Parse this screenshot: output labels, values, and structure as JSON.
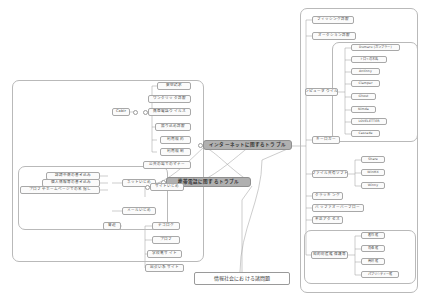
{
  "diagram": {
    "title": "情報社会における諸問題",
    "type": "mind-map",
    "colors": {
      "node_border": "#a8a8a8",
      "node_fill": "#fbfbfb",
      "central_fill": "#b0b0b0",
      "group_border": "#b9b9b9",
      "connector": "#9b9b9b",
      "background": "#ffffff"
    }
  },
  "root": {
    "label": "情報社会における諸問題"
  },
  "central_nodes": {
    "internet": "インターネットに関するトラブル",
    "mobile": "携帯電話に関するトラブル"
  },
  "mobile_branch": {
    "group_label": "mobile-phone-trouble-group",
    "items": [
      {
        "label": "架空請求"
      },
      {
        "label": "ワンクリック詐欺"
      },
      {
        "label": "携帯電話ウイルス",
        "child": "Cabir"
      },
      {
        "label": "振り込め詐欺"
      },
      {
        "label": "利用規約"
      },
      {
        "label": "利用規制"
      },
      {
        "label": "公共の場でのマナー"
      }
    ]
  },
  "bullying_branch": {
    "site_bullying": {
      "label": "サイトいじめ",
      "children": [
        {
          "label": "デコログ"
        },
        {
          "label": "プロフ"
        },
        {
          "label": "学校裏サイト"
        },
        {
          "label": "出会い系サイト"
        }
      ]
    },
    "net_bullying": {
      "label": "ネットいじめ",
      "children": [
        {
          "label": "誹謗中傷の書き込み"
        },
        {
          "label": "個人情報等の書き込み"
        },
        {
          "label": "プロフやホームページでの名指し"
        }
      ]
    },
    "mail_bullying": {
      "label": "メールいじめ",
      "children": [
        {
          "label": "脅迫"
        }
      ]
    }
  },
  "internet_branch": {
    "phishing": "フィッシング詐欺",
    "auction_fraud": "オークション詐欺",
    "virus": {
      "label": "コンピュータウイルス",
      "children": [
        {
          "label": "Dumaru (ガンブラー)"
        },
        {
          "label": "トロイの木馬"
        },
        {
          "label": "Antinny"
        },
        {
          "label": "Clamper"
        },
        {
          "label": "Ghost"
        },
        {
          "label": "Nimda"
        },
        {
          "label": "LOVELETTER"
        },
        {
          "label": "Cascade"
        }
      ]
    },
    "keylogger": "キーロガー",
    "file_sharing": {
      "label": "ファイル共有ソフト",
      "children": [
        {
          "label": "Share"
        },
        {
          "label": "WinMX"
        },
        {
          "label": "Winny"
        }
      ]
    },
    "cracking": "クラッキング",
    "buffer_overflow": "バッファオーバーフロー",
    "unauthorized_access": "不正アクセス",
    "ip_rights": {
      "label": "知的財産権保護等",
      "children": [
        {
          "label": "著作権"
        },
        {
          "label": "肖像権"
        },
        {
          "label": "商標権"
        },
        {
          "label": "パブリシティー権"
        }
      ]
    }
  }
}
